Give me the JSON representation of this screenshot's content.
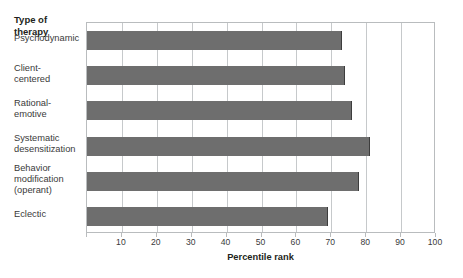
{
  "chart_data": {
    "type": "bar",
    "orientation": "horizontal",
    "title": "",
    "xlabel": "Percentile rank",
    "ylabel": "Type of therapy",
    "xlim": [
      0,
      100
    ],
    "xticks": [
      0,
      10,
      20,
      30,
      40,
      50,
      60,
      70,
      80,
      90,
      100
    ],
    "xtick_labels": [
      "",
      "10",
      "20",
      "30",
      "40",
      "50",
      "60",
      "70",
      "80",
      "90",
      "100"
    ],
    "grid": true,
    "legend": false,
    "categories": [
      "Psychodynamic",
      "Client-\ncentered",
      "Rational-\nemotive",
      "Systematic\ndesensitization",
      "Behavior\nmodification\n(operant)",
      "Eclectic"
    ],
    "values": [
      73,
      74,
      76,
      81,
      78,
      69
    ],
    "bar_color": "#6e6e6e",
    "bar_edge_color": "#3d3d3d",
    "gridline_color": "#c6c9cb",
    "axis_color": "#b9bcbe",
    "background_color": "#ffffff"
  },
  "labels": {
    "category_header": "Type of\ntherapy",
    "x_axis_title": "Percentile rank"
  }
}
